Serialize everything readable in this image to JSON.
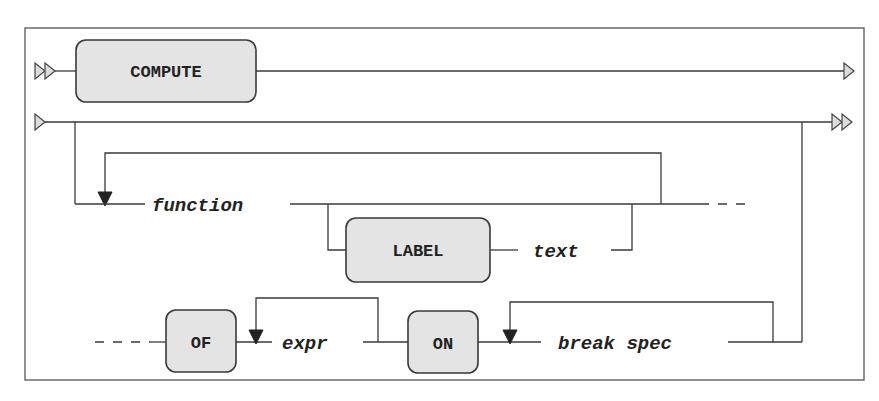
{
  "diagram": {
    "type": "syntax-railroad",
    "statement_keyword": "COMPUTE",
    "keywords": {
      "compute": "COMPUTE",
      "label": "LABEL",
      "of": "OF",
      "on": "ON"
    },
    "variables": {
      "function": "function",
      "text": "text",
      "expr": "expr",
      "break_spec": "break spec"
    },
    "markers": {
      "start_statement": "double-arrow-start",
      "end_line": "single-arrow-end",
      "continue_start": "single-arrow-start",
      "end_statement": "double-arrow-end"
    },
    "colors": {
      "line": "#3a3a3a",
      "box_fill": "#e4e4e4",
      "background": "#ffffff"
    }
  }
}
